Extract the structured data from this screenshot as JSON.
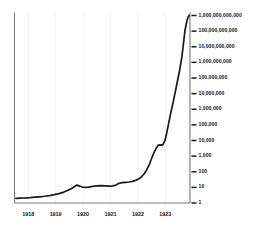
{
  "chart_data": {
    "type": "line",
    "title": "",
    "subtitle": "",
    "xlabel": "",
    "ylabel": "",
    "yscale": "log",
    "ylim": [
      1,
      1000000000000
    ],
    "xlim": [
      1917.5,
      1923.9
    ],
    "grid": "vertical-only",
    "legend": null,
    "annotations": [],
    "ytick_labels": [
      "1,000,000,000,000",
      "100,000,000,000",
      "10,000,000,000",
      "1,000,000,000",
      "100,000,000",
      "10,000,000",
      "1,000,000",
      "100,000",
      "10,000",
      "1,000",
      "100",
      "10",
      "1"
    ],
    "ytick_values": [
      1000000000000,
      100000000000,
      10000000000,
      1000000000,
      100000000,
      10000000,
      1000000,
      100000,
      10000,
      1000,
      100,
      10,
      1
    ],
    "xtick_labels": [
      "1918",
      "1919",
      "1920",
      "1921",
      "1922",
      "1923"
    ],
    "xtick_values": [
      1918,
      1919,
      1920,
      1921,
      1922,
      1923
    ],
    "series": [
      {
        "name": "Price index",
        "color": "#1a1a1a",
        "x": [
          1917.55,
          1917.72,
          1917.9,
          1918.08,
          1918.25,
          1918.42,
          1918.6,
          1918.78,
          1918.95,
          1919.12,
          1919.3,
          1919.45,
          1919.58,
          1919.68,
          1919.78,
          1919.88,
          1919.97,
          1920.08,
          1920.2,
          1920.35,
          1920.5,
          1920.65,
          1920.8,
          1920.95,
          1921.08,
          1921.2,
          1921.3,
          1921.42,
          1921.55,
          1921.68,
          1921.8,
          1921.92,
          1922.02,
          1922.12,
          1922.22,
          1922.32,
          1922.42,
          1922.5,
          1922.58,
          1922.66,
          1922.74,
          1922.82,
          1922.9,
          1922.98,
          1923.05,
          1923.12,
          1923.2,
          1923.28,
          1923.36,
          1923.44,
          1923.52,
          1923.6,
          1923.66,
          1923.72,
          1923.78,
          1923.83,
          1923.87
        ],
        "y": [
          2.0,
          2.05,
          2.1,
          2.2,
          2.35,
          2.5,
          2.7,
          3.0,
          3.4,
          4.0,
          5.0,
          6.5,
          8.5,
          11.0,
          14.0,
          12.0,
          10.5,
          10.0,
          10.5,
          11.5,
          12.5,
          13.0,
          12.5,
          12.0,
          12.5,
          14.0,
          18.0,
          20.0,
          21.0,
          22.0,
          24.0,
          28.0,
          34.0,
          45.0,
          70.0,
          130.0,
          300.0,
          700.0,
          1600.0,
          3000.0,
          5000.0,
          5200.0,
          5000.0,
          9000.0,
          30000.0,
          120000.0,
          600000.0,
          2500000.0,
          12000000.0,
          60000000.0,
          300000000.0,
          2000000000.0,
          15000000000.0,
          120000000000.0,
          400000000000.0,
          800000000000.0,
          1000000000000.0
        ]
      }
    ]
  },
  "axes": {
    "tick_mark_color": "#1a1a1a",
    "spine_color": "#555555",
    "gridline_color": "#f2f2f2"
  }
}
